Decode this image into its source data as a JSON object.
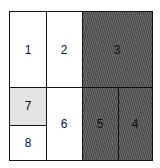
{
  "diagram": {
    "type": "treemap-partition",
    "cells": [
      {
        "id": "1",
        "label": "1",
        "fill": "white"
      },
      {
        "id": "2",
        "label": "2",
        "fill": "white"
      },
      {
        "id": "3",
        "label": "3",
        "fill": "hatched-dark"
      },
      {
        "id": "4",
        "label": "4",
        "fill": "hatched-dark"
      },
      {
        "id": "5",
        "label": "5",
        "fill": "hatched-dark"
      },
      {
        "id": "6",
        "label": "6",
        "fill": "white"
      },
      {
        "id": "7",
        "label": "7",
        "fill": "light-gray"
      },
      {
        "id": "8",
        "label": "8",
        "fill": "white"
      }
    ],
    "colors": {
      "dark": "#5a5a5a",
      "light": "#e4e4e4",
      "border": "#111111"
    }
  }
}
